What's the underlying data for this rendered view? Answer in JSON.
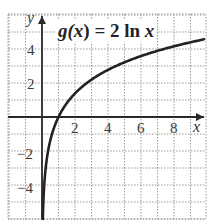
{
  "chart_data": {
    "type": "line",
    "title": "g(x) = 2 ln x",
    "function": "2*ln(x)",
    "xlabel": "x",
    "ylabel": "y",
    "xlim": [
      -2,
      10
    ],
    "ylim": [
      -6,
      6
    ],
    "grid": true,
    "grid_style": "dotted",
    "grid_step": 1,
    "x_ticks": [
      2,
      4,
      6,
      8
    ],
    "y_ticks": [
      4,
      2,
      -2,
      -4
    ],
    "x_tick_labels": [
      "2",
      "4",
      "6",
      "8"
    ],
    "y_tick_labels": [
      "4",
      "2",
      "−2",
      "−4"
    ],
    "series": [
      {
        "name": "g(x) = 2 ln x",
        "x": [
          0.05,
          0.1,
          0.2,
          0.5,
          1,
          2,
          3,
          4,
          5,
          6,
          7,
          8,
          9,
          10
        ],
        "y": [
          -5.99,
          -4.61,
          -3.22,
          -1.39,
          0,
          1.39,
          2.2,
          2.77,
          3.22,
          3.58,
          3.89,
          4.16,
          4.39,
          4.61
        ]
      }
    ],
    "legend": "none",
    "annotations": [
      "g(x) = 2 ln x"
    ]
  },
  "labels": {
    "title_prefix": "g(",
    "title_var": "x",
    "title_mid": ") = 2 ln ",
    "title_var2": "x",
    "x_axis": "x",
    "y_axis": "y",
    "xt": [
      "2",
      "4",
      "6",
      "8"
    ],
    "yt": [
      "4",
      "2",
      "−2",
      "−4"
    ]
  },
  "colors": {
    "curve": "#222222",
    "axis": "#2a2a2a",
    "grid": "#9a9a9a",
    "background": "#ffffff"
  }
}
